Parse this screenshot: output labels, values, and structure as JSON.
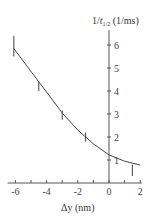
{
  "chart_data": {
    "type": "line",
    "title": "",
    "xlabel": "Δy (nm)",
    "ylabel": "1/t1/2 (1/ms)",
    "ylabel_parts": {
      "prefix": "1/",
      "italic": "t",
      "sub": "1/2",
      "suffix": " (1/ms)"
    },
    "xlim": [
      -6.3,
      2.1
    ],
    "ylim": [
      0,
      6.5
    ],
    "x_ticks_major": [
      -6,
      -4,
      -2,
      0,
      2
    ],
    "x_ticks_minor": [
      -5,
      -3,
      -1,
      1
    ],
    "y_ticks": [
      1,
      2,
      3,
      4,
      5,
      6
    ],
    "grid": false,
    "legend": null,
    "series": [
      {
        "name": "measured",
        "kind": "error-bars",
        "points": [
          {
            "x": -6.1,
            "y": 5.9,
            "ylo": 5.5,
            "yhi": 6.4
          },
          {
            "x": -4.5,
            "y": 4.2,
            "ylo": 4.0,
            "yhi": 4.4
          },
          {
            "x": -3.0,
            "y": 2.95,
            "ylo": 2.75,
            "yhi": 3.15
          },
          {
            "x": -1.5,
            "y": 2.0,
            "ylo": 1.8,
            "yhi": 2.2
          },
          {
            "x": 1.5,
            "y": 0.6,
            "ylo": 0.3,
            "yhi": 0.8
          }
        ]
      },
      {
        "name": "fit",
        "kind": "curve",
        "x": [
          -6.1,
          -5,
          -4,
          -3,
          -2,
          -1,
          0,
          1,
          2
        ],
        "y": [
          5.85,
          4.85,
          3.95,
          3.05,
          2.3,
          1.7,
          1.22,
          0.95,
          0.78
        ]
      }
    ]
  }
}
